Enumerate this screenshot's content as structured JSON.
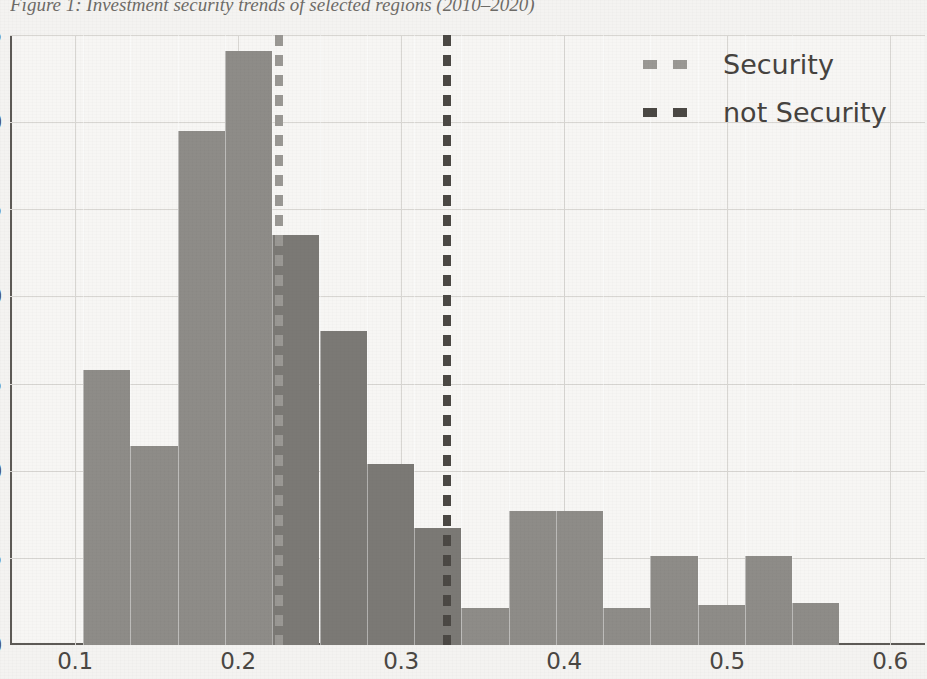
{
  "caption": "Figure 1: Investment security trends of selected regions (2010–2020)",
  "legend": {
    "position": "top-right",
    "items": [
      {
        "label": "Security",
        "color": "#9a9894",
        "marker": "dashed-line-marker"
      },
      {
        "label": "not Security",
        "color": "#4b4844",
        "marker": "dashed-line-marker"
      }
    ]
  },
  "colors": {
    "background": "#f4f3f1",
    "plot_background": "#f7f6f4",
    "bar_fill": "#8e8c88",
    "bar_fill_overlap": "#7b7975",
    "gridline": "#d8d6d2",
    "axis": "#5d5a56",
    "tick_text": "#4a4743",
    "vline_security": "#9a9894",
    "vline_not_security": "#4b4844"
  },
  "chart_data": {
    "type": "bar",
    "title": "Figure 1: Investment security trends of selected regions (2010–2020)",
    "xlabel": "",
    "ylabel": "",
    "xlim": [
      0.1,
      0.6
    ],
    "ylim": [
      0.0,
      0.35
    ],
    "grid": true,
    "legend_position": "upper right",
    "xticks": [
      0.1,
      0.2,
      0.3,
      0.4,
      0.5,
      0.6
    ],
    "xtick_labels": [
      "0.1",
      "0.2",
      "0.3",
      "0.4",
      "0.5",
      "0.6"
    ],
    "yticks": [
      0.0,
      0.05,
      0.1,
      0.15,
      0.2,
      0.25,
      0.3,
      0.35
    ],
    "ytick_labels": [
      "0.00",
      "0.05",
      "0.10",
      "0.15",
      "0.20",
      "0.25",
      "0.30",
      "0.35"
    ],
    "bin_edges": [
      0.105,
      0.134,
      0.163,
      0.192,
      0.221,
      0.25,
      0.279,
      0.308,
      0.337,
      0.366,
      0.395,
      0.424,
      0.453,
      0.482,
      0.511,
      0.54,
      0.569
    ],
    "categories": [
      "0.105-0.134",
      "0.134-0.163",
      "0.163-0.192",
      "0.192-0.221",
      "0.221-0.250",
      "0.250-0.279",
      "0.279-0.308",
      "0.308-0.337",
      "0.337-0.366",
      "0.366-0.395",
      "0.395-0.424",
      "0.424-0.453",
      "0.453-0.482",
      "0.482-0.511",
      "0.511-0.540",
      "0.540-0.569"
    ],
    "values": [
      0.158,
      0.114,
      0.295,
      0.341,
      0.235,
      0.18,
      0.104,
      0.067,
      0.021,
      0.077,
      0.077,
      0.021,
      0.051,
      0.023,
      0.051,
      0.024
    ],
    "annotations": [
      {
        "type": "vline",
        "label": "Security",
        "x": 0.225,
        "style": "dashed",
        "color": "#9a9894"
      },
      {
        "type": "vline",
        "label": "not Security",
        "x": 0.328,
        "style": "dashed",
        "color": "#4b4844"
      }
    ]
  }
}
